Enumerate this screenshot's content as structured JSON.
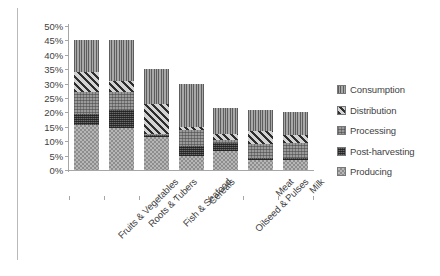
{
  "chart_data": {
    "type": "bar",
    "stacked": true,
    "title": "",
    "xlabel": "",
    "ylabel": "",
    "ylim": [
      0,
      50
    ],
    "ytick_values": [
      0,
      5,
      10,
      15,
      20,
      25,
      30,
      35,
      40,
      45,
      50
    ],
    "ytick_labels": [
      "0%",
      "5%",
      "10%",
      "15%",
      "20%",
      "25%",
      "30%",
      "35%",
      "40%",
      "45%",
      "50%"
    ],
    "grid": false,
    "legend_position": "right",
    "categories": [
      "Fruits & Vegetables",
      "Roots & Tubers",
      "Fish & Seafood",
      "Cereals",
      "Oilseed & Pulses",
      "Meat",
      "Milk"
    ],
    "series": [
      {
        "name": "Producing",
        "pattern": "light-checker",
        "values": [
          15.5,
          14.5,
          11.5,
          5.0,
          6.5,
          3.5,
          3.5
        ]
      },
      {
        "name": "Post-harvesting",
        "pattern": "dark-weave",
        "values": [
          4.0,
          6.5,
          0.5,
          3.5,
          3.0,
          0.5,
          0.5
        ]
      },
      {
        "name": "Processing",
        "pattern": "medium-weave",
        "values": [
          7.5,
          6.0,
          0.5,
          5.5,
          1.0,
          5.0,
          5.5
        ]
      },
      {
        "name": "Distribution",
        "pattern": "diagonal-stripe",
        "values": [
          7.0,
          4.0,
          10.5,
          1.0,
          2.0,
          4.5,
          2.5
        ]
      },
      {
        "name": "Consumption",
        "pattern": "vertical-line",
        "values": [
          11.0,
          14.0,
          12.0,
          15.0,
          9.0,
          7.5,
          8.0
        ]
      }
    ],
    "totals": [
      45.0,
      45.0,
      35.0,
      30.0,
      21.5,
      21.0,
      20.0
    ]
  },
  "legend": {
    "entries": [
      {
        "label": "Consumption"
      },
      {
        "label": "Distribution"
      },
      {
        "label": "Processing"
      },
      {
        "label": "Post-harvesting"
      },
      {
        "label": "Producing"
      }
    ]
  },
  "colors": {
    "axis": "#a6a6a6",
    "text": "#3f3f3f",
    "background": "#ffffff",
    "frame": "#b9b9b9"
  }
}
